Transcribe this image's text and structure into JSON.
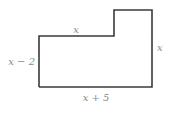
{
  "diagram": {
    "type": "composite rectilinear shape",
    "stroke_color": "#3a3a3a",
    "label_color": "#8a8a8a",
    "labels": {
      "top_left_edge": "x",
      "left_edge": "x − 2",
      "right_edge": "x",
      "bottom_edge": "x + 5"
    }
  }
}
